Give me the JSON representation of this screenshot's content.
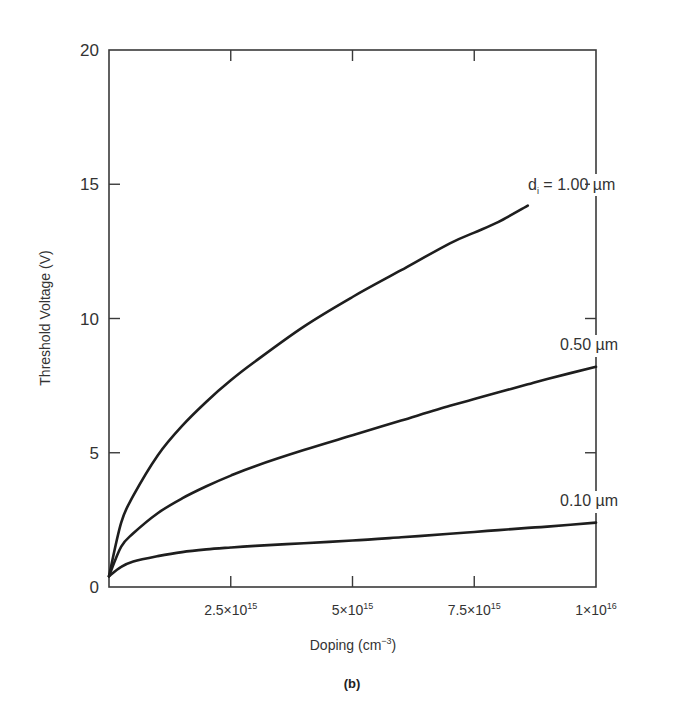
{
  "chart_data": {
    "type": "line",
    "title": "",
    "caption": "(b)",
    "xlabel": "Doping (cm⁻³)",
    "xlabel_base": "Doping (cm",
    "xlabel_sup": "−3",
    "xlabel_close": ")",
    "ylabel": "Threshold Voltage (V)",
    "xlim": [
      0,
      1e+16
    ],
    "ylim": [
      0,
      20
    ],
    "grid": false,
    "legend_position": "inline labels at right end of each curve",
    "x_ticks": [
      {
        "value": 2500000000000000.0,
        "mantissa": "2.5×10",
        "exp": "15"
      },
      {
        "value": 5000000000000000.0,
        "mantissa": "5×10",
        "exp": "15"
      },
      {
        "value": 7500000000000000.0,
        "mantissa": "7.5×10",
        "exp": "15"
      },
      {
        "value": 1e+16,
        "mantissa": "1×10",
        "exp": "16"
      }
    ],
    "y_ticks": [
      {
        "value": 0,
        "label": "0"
      },
      {
        "value": 5,
        "label": "5"
      },
      {
        "value": 10,
        "label": "10"
      },
      {
        "value": 15,
        "label": "15"
      },
      {
        "value": 20,
        "label": "20"
      }
    ],
    "x": [
      0,
      250000000000000.0,
      500000000000000.0,
      1000000000000000.0,
      1500000000000000.0,
      2000000000000000.0,
      2500000000000000.0,
      3000000000000000.0,
      4000000000000000.0,
      5000000000000000.0,
      6000000000000000.0,
      7000000000000000.0,
      7500000000000000.0,
      8000000000000000.0,
      8600000000000000.0,
      9000000000000000.0,
      1e+16
    ],
    "series": [
      {
        "name": "dᵢ = 1.00 µm",
        "label_prefix": "d",
        "label_sub": "i",
        "label_rest": " = 1.00 µm",
        "values": [
          0.4,
          2.4,
          3.4,
          4.9,
          6.0,
          6.9,
          7.7,
          8.4,
          9.7,
          10.8,
          11.8,
          12.8,
          13.2,
          13.6,
          14.2,
          null,
          null
        ]
      },
      {
        "name": "0.50 µm",
        "values": [
          0.4,
          1.5,
          2.0,
          2.75,
          3.3,
          3.75,
          4.15,
          4.5,
          5.1,
          5.65,
          6.2,
          6.75,
          7.0,
          7.25,
          7.55,
          7.75,
          8.2
        ]
      },
      {
        "name": "0.10 µm",
        "values": [
          0.4,
          0.75,
          0.95,
          1.15,
          1.3,
          1.4,
          1.47,
          1.53,
          1.63,
          1.73,
          1.85,
          1.98,
          2.05,
          2.12,
          2.2,
          2.25,
          2.4
        ]
      }
    ]
  }
}
